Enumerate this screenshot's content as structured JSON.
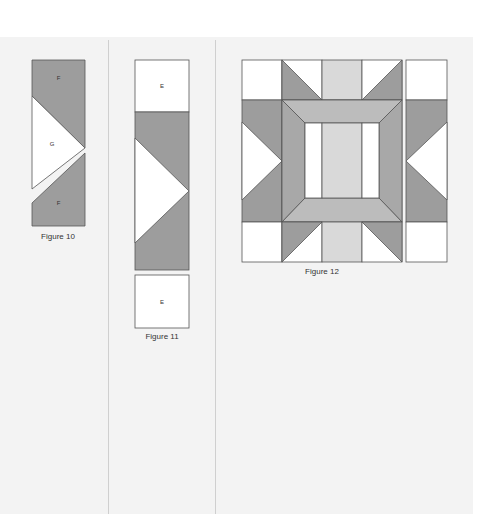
{
  "colors": {
    "dark_gray": "#9d9d9d",
    "medium_gray": "#bcbcbc",
    "light_gray": "#d9d9d9",
    "white": "#ffffff",
    "outline": "#555555",
    "page_background": "#f3f3f3"
  },
  "figures": [
    {
      "id": "figure-10",
      "caption": "Figure 10",
      "pieces": [
        {
          "label": "F",
          "fill": "dark_gray",
          "position": "top"
        },
        {
          "label": "G",
          "fill": "white",
          "position": "middle-triangle"
        },
        {
          "label": "F",
          "fill": "dark_gray",
          "position": "bottom"
        }
      ]
    },
    {
      "id": "figure-11",
      "caption": "Figure 11",
      "pieces": [
        {
          "label": "E",
          "fill": "white",
          "position": "top-square"
        },
        {
          "label": "",
          "fill": "dark_gray",
          "position": "flying-geese-unit"
        },
        {
          "label": "E",
          "fill": "white",
          "position": "bottom-square"
        }
      ]
    },
    {
      "id": "figure-12",
      "caption": "Figure 12",
      "grid": "4 columns x 5 rows block plus a separate right strip",
      "pieces": [
        {
          "part": "corner-squares",
          "fill": "white"
        },
        {
          "part": "half-square-triangles",
          "fill": "dark_gray"
        },
        {
          "part": "center-strip",
          "fill": "light_gray"
        },
        {
          "part": "mitered-frame",
          "fill": "medium_gray"
        },
        {
          "part": "side-frame",
          "fill": "dark_gray"
        },
        {
          "part": "inner-windows",
          "fill": "white"
        }
      ]
    }
  ]
}
